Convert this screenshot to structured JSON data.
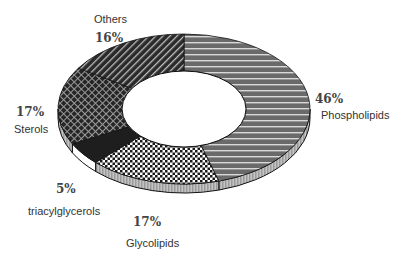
{
  "chart_data": {
    "type": "pie",
    "variant": "3d-donut",
    "title": "",
    "start_angle": "12 o'clock",
    "direction": "clockwise",
    "categories": [
      "Phospholipids",
      "Glycolipids",
      "triacylglycerols",
      "Sterols",
      "Others"
    ],
    "values": [
      46,
      17,
      5,
      17,
      16
    ],
    "unit": "%",
    "legend": "none (direct labels)",
    "slices": [
      {
        "name": "Phospholipids",
        "value": 46,
        "pct_label": "46%",
        "pattern": "horizontal-lines-on-gray"
      },
      {
        "name": "Glycolipids",
        "value": 17,
        "pct_label": "17%",
        "pattern": "checkerboard"
      },
      {
        "name": "triacylglycerols",
        "value": 5,
        "pct_label": "5%",
        "pattern": "solid-dark"
      },
      {
        "name": "Sterols",
        "value": 17,
        "pct_label": "17%",
        "pattern": "crosshatch"
      },
      {
        "name": "Others",
        "value": 16,
        "pct_label": "16%",
        "pattern": "diagonal-lines"
      }
    ]
  },
  "labels": {
    "others": {
      "name": "Others",
      "pct": "16%"
    },
    "phospholipids": {
      "name": "Phospholipids",
      "pct": "46%"
    },
    "sterols": {
      "name": "Sterols",
      "pct": "17%"
    },
    "triacylglycerols": {
      "name": "triacylglycerols",
      "pct": "5%"
    },
    "glycolipids": {
      "name": "Glycolipids",
      "pct": "17%"
    }
  },
  "colors": {
    "phospholipids": "#6e6e6e",
    "glycolipids": "#ffffff",
    "triacylglycerols": "#1e1e1e",
    "sterols": "#2a2a2a",
    "others": "#2f2f2f",
    "outline": "#111111"
  }
}
